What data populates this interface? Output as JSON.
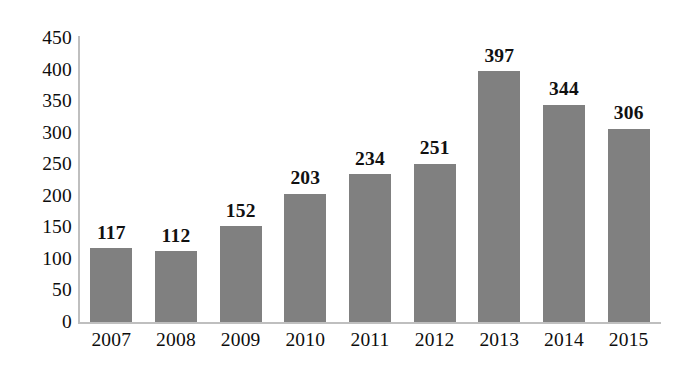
{
  "chart_data": {
    "type": "bar",
    "title": "",
    "subtitle": "",
    "xlabel": "",
    "ylabel": "",
    "categories": [
      "2007",
      "2008",
      "2009",
      "2010",
      "2011",
      "2012",
      "2013",
      "2014",
      "2015"
    ],
    "values": [
      117,
      112,
      152,
      203,
      234,
      251,
      397,
      344,
      306
    ],
    "data_labels": [
      "117",
      "112",
      "152",
      "203",
      "234",
      "251",
      "397",
      "344",
      "306"
    ],
    "ylim": [
      0,
      450
    ],
    "y_ticks": [
      450,
      400,
      350,
      300,
      250,
      200,
      150,
      100,
      50,
      0
    ],
    "y_tick_labels": [
      "450",
      "400",
      "350",
      "300",
      "250",
      "200",
      "150",
      "100",
      "50",
      "0"
    ],
    "grid": false,
    "legend": null,
    "legend_position": "none",
    "series": [
      {
        "name": "",
        "values": [
          117,
          112,
          152,
          203,
          234,
          251,
          397,
          344,
          306
        ],
        "color": "#808080"
      }
    ],
    "colors": {
      "bar": "#808080",
      "axis": "#bfbfbf",
      "text": "#0d0d0d",
      "data_label": "#111111",
      "background": "#ffffff"
    }
  }
}
